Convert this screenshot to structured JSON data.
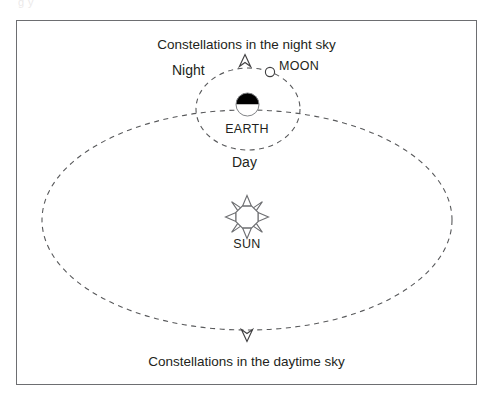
{
  "figure": {
    "top_bleed_text": "g                                            y",
    "frame": {
      "border_color": "#6d6e71",
      "x": 16,
      "y": 20,
      "width": 461,
      "height": 365
    },
    "captions": {
      "night_sky": "Constellations in the night sky",
      "daytime_sky": "Constellations in the daytime sky"
    },
    "zone_labels": {
      "night": "Night",
      "day": "Day"
    },
    "bodies": [
      {
        "name": "EARTH",
        "label": "EARTH",
        "shape": "half-black-half-white-circle",
        "cx": 247.5,
        "cy": 104.5,
        "r": 11.5,
        "fill_top": "#000000",
        "fill_bottom": "#ffffff",
        "stroke": "#808285"
      },
      {
        "name": "MOON",
        "label": "MOON",
        "shape": "small-open-circle",
        "cx": 270,
        "cy": 72,
        "r": 4.6,
        "fill": "#ffffff",
        "stroke": "#414042"
      },
      {
        "name": "SUN",
        "label": "SUN",
        "shape": "eight-rayed-sun-outline",
        "cx": 247,
        "cy": 217,
        "r": 11.5,
        "ray_count": 8,
        "fill": "#ffffff",
        "stroke": "#6d6e71"
      }
    ],
    "orbits": [
      {
        "name": "earth-orbit-around-sun",
        "type": "ellipse",
        "cx": 247,
        "cy": 220,
        "rx": 205,
        "ry": 110,
        "style": "dashed",
        "stroke": "#58595b"
      },
      {
        "name": "moon-orbit-around-earth",
        "type": "ellipse",
        "cx": 248,
        "cy": 109,
        "rx": 52,
        "ry": 41,
        "style": "dashed",
        "stroke": "#58595b"
      }
    ],
    "direction_arrows": [
      {
        "name": "moon-orbit-direction-arrow",
        "glyph": "open-arrowhead-up",
        "x": 245,
        "y": 62,
        "points": "up"
      },
      {
        "name": "earth-orbit-direction-arrow",
        "glyph": "open-arrowhead-down",
        "x": 247,
        "y": 334,
        "points": "down"
      }
    ],
    "colors": {
      "ink": "#231f20",
      "line": "#58595b",
      "frame": "#6d6e71",
      "earth_night_side": "#000000",
      "page_background": "#ffffff"
    }
  }
}
